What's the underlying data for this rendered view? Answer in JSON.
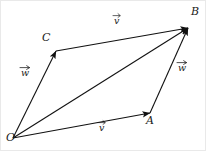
{
  "figure": {
    "kind": "vector-parallelogram-diagram",
    "width": 206,
    "height": 151,
    "background_color": "#ffffff",
    "stroke_color": "#111111",
    "text_color": "#1a1a1a"
  },
  "points": [
    {
      "id": "O",
      "label": "O",
      "x": 12,
      "y": 137,
      "label_x": 5,
      "label_y": 132
    },
    {
      "id": "C",
      "label": "C",
      "x": 55,
      "y": 50,
      "label_x": 41,
      "label_y": 32
    },
    {
      "id": "A",
      "label": "A",
      "x": 149,
      "y": 112,
      "label_x": 145,
      "label_y": 115
    },
    {
      "id": "B",
      "label": "B",
      "x": 187,
      "y": 27,
      "label_x": 190,
      "label_y": 6
    }
  ],
  "vectors": [
    {
      "id": "OC",
      "from": "O",
      "to": "C",
      "label": "w",
      "accent": "vector-arrow",
      "label_x": 20,
      "label_y": 66
    },
    {
      "id": "OA",
      "from": "O",
      "to": "A",
      "label": "v",
      "accent": "vector-arrow",
      "label_x": 98,
      "label_y": 121
    },
    {
      "id": "OB",
      "from": "O",
      "to": "B",
      "label": "",
      "accent": "none",
      "label_x": 0,
      "label_y": 0
    },
    {
      "id": "CB",
      "from": "C",
      "to": "B",
      "label": "v",
      "accent": "vector-arrow",
      "label_x": 113,
      "label_y": 14
    },
    {
      "id": "AB",
      "from": "A",
      "to": "B",
      "label": "w",
      "accent": "vector-arrow",
      "label_x": 177,
      "label_y": 61
    }
  ]
}
